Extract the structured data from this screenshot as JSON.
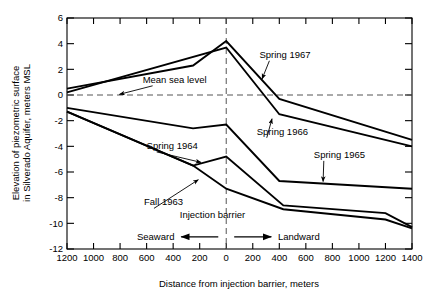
{
  "chart_data": {
    "type": "line",
    "title": "",
    "xlabel": "Distance from injection barrier, meters",
    "ylabel": "Elevation of piezometric surface in Silverado Aquifer, meters MSL",
    "ylabel_line1": "Elevation of piezometric surface",
    "ylabel_line2": "in Silverado Aquifer, meters MSL",
    "xlim": [
      -1200,
      1400
    ],
    "ylim": [
      -12,
      6
    ],
    "xticks": [
      -1200,
      -1000,
      -800,
      -600,
      -400,
      -200,
      0,
      200,
      400,
      600,
      800,
      1000,
      1200,
      1400
    ],
    "xticklabels": [
      "1200",
      "1000",
      "800",
      "600",
      "400",
      "200",
      "0",
      "200",
      "400",
      "600",
      "800",
      "1000",
      "1200",
      "1400"
    ],
    "yticks": [
      -12,
      -10,
      -8,
      -6,
      -4,
      -2,
      0,
      2,
      4,
      6
    ],
    "yticklabels": [
      "-12",
      "-10",
      "-8",
      "-6",
      "-4",
      "-2",
      "0",
      "2",
      "4",
      "6"
    ],
    "grid": false,
    "legend_position": "inline-annotations",
    "series": [
      {
        "name": "Spring 1967",
        "x": [
          -1200,
          -250,
          0,
          400,
          1400
        ],
        "values": [
          0.5,
          2.3,
          4.2,
          -0.3,
          -3.5
        ]
      },
      {
        "name": "Spring 1966",
        "x": [
          -1200,
          0,
          400,
          1400
        ],
        "values": [
          0.2,
          3.7,
          -1.5,
          -4.0
        ]
      },
      {
        "name": "Spring 1965",
        "x": [
          -1200,
          -250,
          0,
          400,
          1400
        ],
        "values": [
          -1.0,
          -2.6,
          -2.3,
          -6.7,
          -7.3
        ]
      },
      {
        "name": "Spring 1964",
        "x": [
          -1200,
          -250,
          0,
          430,
          1200,
          1400
        ],
        "values": [
          -1.3,
          -5.5,
          -4.8,
          -8.6,
          -9.2,
          -10.3
        ]
      },
      {
        "name": "Fall 1963",
        "x": [
          -1200,
          -250,
          0,
          430,
          1200,
          1400
        ],
        "values": [
          -1.3,
          -5.5,
          -7.3,
          -8.9,
          -9.7,
          -10.4
        ]
      }
    ],
    "reference_lines": [
      {
        "name": "Mean sea level",
        "orientation": "horizontal",
        "value": 0,
        "style": "dashed"
      },
      {
        "name": "Injection barrier",
        "orientation": "vertical",
        "value": 0,
        "style": "dashed"
      }
    ],
    "annotations": [
      {
        "id": "mean-sea-level",
        "text": "Mean sea level",
        "x": 9,
        "y": 6,
        "tx": -630,
        "ty": 0.95,
        "px": -805,
        "py": 0.05
      },
      {
        "id": "spring-1967",
        "text": "Spring 1967",
        "x": 9,
        "y": 6,
        "tx": 250,
        "ty": 2.9,
        "px": 270,
        "py": 1.25
      },
      {
        "id": "spring-1966",
        "text": "Spring 1966",
        "x": 9,
        "y": 6,
        "tx": 230,
        "ty": -3.1,
        "px": 345,
        "py": -1.85
      },
      {
        "id": "spring-1965",
        "text": "Spring 1965",
        "x": 9,
        "y": 6,
        "tx": 660,
        "ty": -4.9,
        "px": 730,
        "py": -6.75
      },
      {
        "id": "spring-1964",
        "text": "Spring 1964",
        "x": 9,
        "y": 6,
        "tx": -600,
        "ty": -4.2,
        "px": -190,
        "py": -5.25
      },
      {
        "id": "fall-1963",
        "text": "Fall 1963",
        "x": 9,
        "y": 6,
        "tx": -620,
        "ty": -8.6,
        "px": -210,
        "py": -6.6
      },
      {
        "id": "injection-barrier",
        "text": "Injection barrier",
        "x": 9,
        "y": 6,
        "tx": -350,
        "ty": -9.6
      }
    ],
    "direction_markers": [
      {
        "id": "seaward",
        "label": "Seaward",
        "direction": "left"
      },
      {
        "id": "landward",
        "label": "Landward",
        "direction": "right"
      }
    ]
  }
}
